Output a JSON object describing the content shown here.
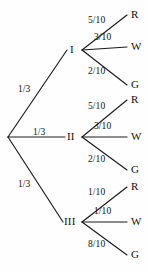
{
  "diagram": {
    "background_color": "#fefefe",
    "line_color": "#1a1a1a",
    "text_color": "#111111",
    "root": {
      "label": "",
      "x": 8,
      "y": 137
    },
    "level1": [
      {
        "node_label": "I",
        "branch_probability": "1/3",
        "node_x": 70,
        "node_y": 50,
        "prob_x": 18,
        "prob_y": 85,
        "fan_x": 82,
        "outcomes": [
          {
            "probability": "5/10",
            "outcome": "R",
            "leaf_x": 131,
            "leaf_y": 15,
            "prob_x": 88,
            "prob_y": 21
          },
          {
            "probability": "3/10",
            "outcome": "W",
            "leaf_x": 131,
            "leaf_y": 47,
            "prob_x": 94,
            "prob_y": 38
          },
          {
            "probability": "2/10",
            "outcome": "G",
            "leaf_x": 131,
            "leaf_y": 85,
            "prob_x": 88,
            "prob_y": 72
          }
        ]
      },
      {
        "node_label": "II",
        "branch_probability": "1/3",
        "node_x": 68,
        "node_y": 137,
        "prob_x": 33,
        "prob_y": 128,
        "fan_x": 82,
        "outcomes": [
          {
            "probability": "5/10",
            "outcome": "R",
            "leaf_x": 131,
            "leaf_y": 100,
            "prob_x": 88,
            "prob_y": 107
          },
          {
            "probability": "3/10",
            "outcome": "W",
            "leaf_x": 131,
            "leaf_y": 137,
            "prob_x": 94,
            "prob_y": 127
          },
          {
            "probability": "2/10",
            "outcome": "G",
            "leaf_x": 131,
            "leaf_y": 170,
            "prob_x": 88,
            "prob_y": 160
          }
        ]
      },
      {
        "node_label": "III",
        "branch_probability": "1/3",
        "node_x": 66,
        "node_y": 222,
        "prob_x": 18,
        "prob_y": 180,
        "fan_x": 82,
        "outcomes": [
          {
            "probability": "1/10",
            "outcome": "R",
            "leaf_x": 131,
            "leaf_y": 187,
            "prob_x": 88,
            "prob_y": 193
          },
          {
            "probability": "1/10",
            "outcome": "W",
            "leaf_x": 131,
            "leaf_y": 222,
            "prob_x": 94,
            "prob_y": 212
          },
          {
            "probability": "8/10",
            "outcome": "G",
            "leaf_x": 131,
            "leaf_y": 255,
            "prob_x": 88,
            "prob_y": 245
          }
        ]
      }
    ]
  }
}
